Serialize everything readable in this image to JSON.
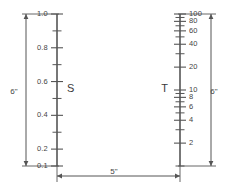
{
  "figure": {
    "background_color": "#ffffff",
    "line_color": "#555555",
    "text_color": "#444444"
  },
  "scales": [
    {
      "id": "S",
      "name_label": "S",
      "name_side": "right",
      "type": "linear",
      "height_label": "6\"",
      "axis_x": 57,
      "axis_top_y": 14,
      "axis_bottom_y": 166,
      "range": [
        0.1,
        1.0
      ],
      "labeled_ticks": [
        {
          "value": 1.0,
          "text": "1.0"
        },
        {
          "value": 0.8,
          "text": "0.8"
        },
        {
          "value": 0.6,
          "text": "0.6"
        },
        {
          "value": 0.4,
          "text": "0.4"
        },
        {
          "value": 0.2,
          "text": "0.2"
        },
        {
          "value": 0.1,
          "text": "0.1"
        }
      ],
      "minor_ticks": [
        0.9,
        0.7,
        0.5,
        0.3
      ],
      "label_side": "left"
    },
    {
      "id": "T",
      "name_label": "T",
      "name_side": "left",
      "type": "logarithmic",
      "height_label": "6\"",
      "axis_x": 180,
      "axis_top_y": 14,
      "axis_bottom_y": 166,
      "range": [
        1,
        100
      ],
      "labeled_ticks": [
        {
          "value": 100,
          "text": "100"
        },
        {
          "value": 80,
          "text": "80"
        },
        {
          "value": 60,
          "text": "60"
        },
        {
          "value": 40,
          "text": "40"
        },
        {
          "value": 20,
          "text": "20"
        },
        {
          "value": 10,
          "text": "10"
        },
        {
          "value": 8,
          "text": "8"
        },
        {
          "value": 6,
          "text": "6"
        },
        {
          "value": 4,
          "text": "4"
        },
        {
          "value": 2,
          "text": "2"
        }
      ],
      "minor_ticks": [
        90,
        70,
        50,
        30,
        9,
        7,
        5,
        3,
        1
      ],
      "label_side": "right"
    }
  ],
  "dimensions": [
    {
      "id": "left-height",
      "label": "6\"",
      "orientation": "vertical",
      "x": 26,
      "y1": 14,
      "y2": 166,
      "label_x": 14,
      "label_y": 92
    },
    {
      "id": "right-height",
      "label": "6\"",
      "orientation": "vertical",
      "x": 211,
      "y1": 14,
      "y2": 166,
      "label_x": 214,
      "label_y": 92
    },
    {
      "id": "separation",
      "label": "5\"",
      "orientation": "horizontal",
      "y": 176,
      "x1": 57,
      "x2": 180,
      "label_x": 114,
      "label_y": 172
    }
  ]
}
